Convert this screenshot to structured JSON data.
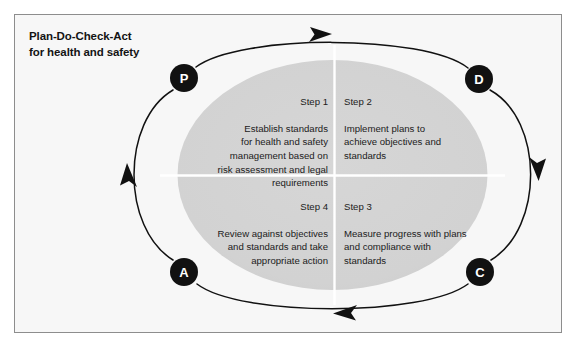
{
  "figure": {
    "title_line_1": "Plan-Do-Check-Act",
    "title_line_2": "for health and safety",
    "panel_background": "#f7f7f7",
    "panel_border_color": "#8d8d8d",
    "ellipse_fill": "#d2d2d2",
    "divider_color": "#ffffff",
    "arrow_color": "#111111",
    "node_fill": "#111111",
    "node_text_color": "#ffffff"
  },
  "nodes": [
    {
      "id": "node-p",
      "letter": "P",
      "position": "top-left",
      "cx": 184,
      "cy": 78,
      "r": 14
    },
    {
      "id": "node-d",
      "letter": "D",
      "position": "top-right",
      "cx": 479,
      "cy": 79,
      "r": 14
    },
    {
      "id": "node-c",
      "letter": "C",
      "position": "bottom-right",
      "cx": 480,
      "cy": 272,
      "r": 14
    },
    {
      "id": "node-a",
      "letter": "A",
      "position": "bottom-left",
      "cx": 184,
      "cy": 272,
      "r": 14
    }
  ],
  "quadrants": [
    {
      "id": "quad-1",
      "step": "Step 1",
      "body": "Establish standards\nfor health and safety\nmanagement based on\nrisk assessment and legal\nrequirements",
      "align": "right",
      "position": "top-left"
    },
    {
      "id": "quad-2",
      "step": "Step 2",
      "body": "Implement plans to\nachieve objectives and\nstandards",
      "align": "left",
      "position": "top-right"
    },
    {
      "id": "quad-3",
      "step": "Step 3",
      "body": "Measure progress with plans\nand compliance with\nstandards",
      "align": "left",
      "position": "bottom-right"
    },
    {
      "id": "quad-4",
      "step": "Step 4",
      "body": "Review against objectives\nand standards and take\nappropriate action",
      "align": "right",
      "position": "bottom-left"
    }
  ],
  "arrows": [
    {
      "id": "arrow-top",
      "direction": "right",
      "from": "node-p",
      "to": "node-d"
    },
    {
      "id": "arrow-right",
      "direction": "down",
      "from": "node-d",
      "to": "node-c"
    },
    {
      "id": "arrow-bottom",
      "direction": "left",
      "from": "node-c",
      "to": "node-a"
    },
    {
      "id": "arrow-left",
      "direction": "up",
      "from": "node-a",
      "to": "node-p"
    }
  ]
}
